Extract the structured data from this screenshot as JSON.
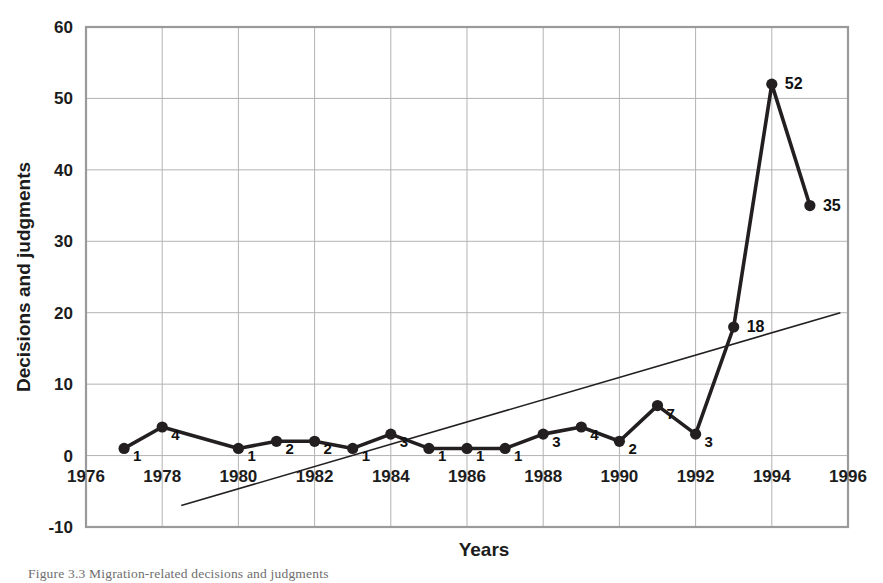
{
  "figure": {
    "caption": "Figure 3.3  Migration-related decisions and judgments"
  },
  "axes": {
    "x_title": "Years",
    "y_title": "Decisions and judgments",
    "x_ticks": [
      "1976",
      "1978",
      "1980",
      "1982",
      "1984",
      "1986",
      "1988",
      "1990",
      "1992",
      "1994",
      "1996"
    ],
    "y_ticks": [
      "60",
      "50",
      "40",
      "30",
      "20",
      "10",
      "0",
      "-10"
    ]
  },
  "colors": {
    "series_line": "#231f20",
    "trend_line": "#231f20",
    "grid": "#b3b3b3",
    "frame": "#9a9a9a",
    "text": "#1c1c1c",
    "background": "#ffffff"
  },
  "chart_data": {
    "type": "line",
    "title": "",
    "subtitle": "",
    "xlabel": "Years",
    "ylabel": "Decisions and judgments",
    "xlim": [
      1976,
      1996
    ],
    "ylim": [
      -10,
      60
    ],
    "x_tick_step": 2,
    "y_tick_step": 10,
    "grid": true,
    "legend": "none",
    "x": [
      1977,
      1978,
      1980,
      1981,
      1982,
      1983,
      1984,
      1985,
      1986,
      1987,
      1988,
      1989,
      1990,
      1991,
      1992,
      1993,
      1994,
      1995
    ],
    "series": [
      {
        "name": "Decisions and judgments",
        "marker": "filled-circle",
        "values": [
          1,
          4,
          1,
          2,
          2,
          1,
          3,
          1,
          1,
          1,
          3,
          4,
          2,
          7,
          3,
          18,
          52,
          35
        ]
      }
    ],
    "point_labels": [
      "1",
      "4",
      "1",
      "2",
      "2",
      "1",
      "3",
      "1",
      "1",
      "1",
      "3",
      "4",
      "2",
      "7",
      "3",
      "18",
      "52",
      "35"
    ],
    "trendline": {
      "type": "linear",
      "x_start": 1978.5,
      "y_start": -7,
      "x_end": 1995.8,
      "y_end": 20
    }
  }
}
